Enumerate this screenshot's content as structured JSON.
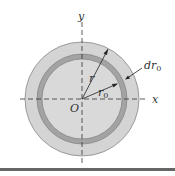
{
  "figure": {
    "type": "annular-ring-cross-section",
    "labels": {
      "y_axis": "y",
      "x_axis": "x",
      "origin": "O",
      "radius_outer": "r",
      "radius_ring": "r",
      "radius_ring_sub": "0",
      "ring_thickness": "dr",
      "ring_thickness_sub": "0"
    },
    "colors": {
      "outer_disk": "#d4d4d4",
      "ring": "#a3a3a3",
      "inner_disk": "#d9d9d9",
      "axis": "#333333",
      "bottom_rule": "#666666"
    }
  }
}
